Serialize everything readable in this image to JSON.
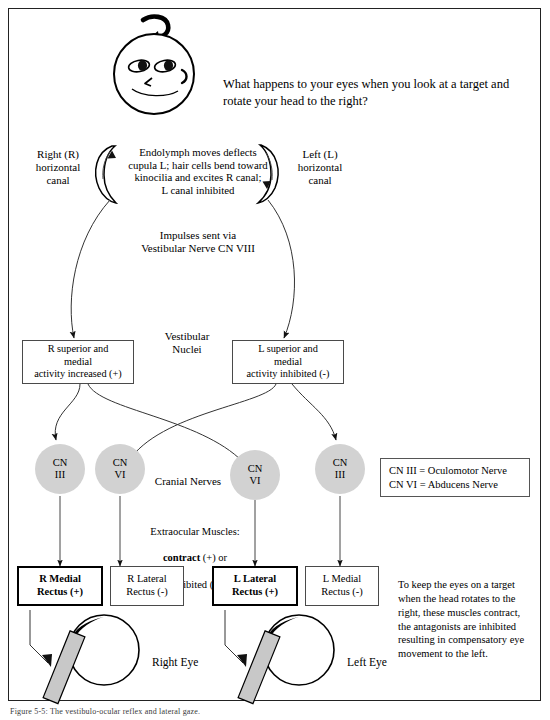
{
  "figure": {
    "question": "What happens to your eyes when you look at a target and rotate your head to the right?",
    "caption": "Figure 5-5: The vestibulo-ocular reflex and lateral gaze.",
    "head_icon": "head-rotating-right-icon"
  },
  "canals": {
    "right_label": "Right (R)\nhorizontal\ncanal",
    "left_label": "Left (L)\nhorizontal\ncanal",
    "endolymph_text": "Endolymph moves deflects\ncupula L; hair cells bend toward\nkinocilia and excites R canal;\nL canal inhibited",
    "impulse_text": "Impulses sent via\nVestibular Nerve CN VIII"
  },
  "nuclei": {
    "middle_label": "Vestibular\nNuclei",
    "right_box": "R superior and\nmedial\nactivity increased (+)",
    "left_box": "L superior and\nmedial\nactivity inhibited (-)"
  },
  "cranial_nerves": {
    "label": "Cranial Nerves",
    "circles": [
      {
        "line1": "CN",
        "line2": "III"
      },
      {
        "line1": "CN",
        "line2": "VI"
      },
      {
        "line1": "CN",
        "line2": "VI"
      },
      {
        "line1": "CN",
        "line2": "III"
      }
    ],
    "legend": {
      "line1": "CN III = Oculomotor Nerve",
      "line2": "CN VI = Abducens Nerve"
    }
  },
  "muscles": {
    "header_plain_1": "Extraocular Muscles:",
    "header_bold": "contract",
    "header_plain_2": " (+) or",
    "header_plain_3": "inhibited (-)",
    "boxes": [
      {
        "line1": "R Medial",
        "line2": "Rectus (+)",
        "emphasis": true
      },
      {
        "line1": "R Lateral",
        "line2": "Rectus (-)",
        "emphasis": false
      },
      {
        "line1": "L Lateral",
        "line2": "Rectus (+)",
        "emphasis": true
      },
      {
        "line1": "L Medial",
        "line2": "Rectus (-)",
        "emphasis": false
      }
    ]
  },
  "eyes": {
    "right_label": "Right Eye",
    "left_label": "Left Eye",
    "summary": "To keep the eyes on a target when the head rotates to the right, these muscles contract, the antagonists are inhibited resulting in compensatory eye movement to the left."
  },
  "colors": {
    "circle_fill": "#d2d2d2",
    "muscle_fill": "#c8c8c8",
    "line": "#1a1a1a",
    "frame": "#222222"
  }
}
